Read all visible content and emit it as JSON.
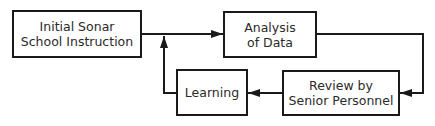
{
  "diagram": {
    "type": "flowchart",
    "colors": {
      "stroke": "#1a1a1a",
      "text": "#2a2a2a",
      "background": "#ffffff"
    },
    "nodes": [
      {
        "id": "initial",
        "lines": [
          "Initial Sonar",
          "School Instruction"
        ]
      },
      {
        "id": "analysis",
        "lines": [
          "Analysis",
          "of Data"
        ]
      },
      {
        "id": "review",
        "lines": [
          "Review by",
          "Senior Personnel"
        ]
      },
      {
        "id": "learning",
        "lines": [
          "Learning"
        ]
      }
    ],
    "edges": [
      {
        "from": "initial",
        "to": "analysis"
      },
      {
        "from": "analysis",
        "to": "review"
      },
      {
        "from": "review",
        "to": "learning"
      },
      {
        "from": "learning",
        "to": "initial-analysis-link"
      }
    ]
  }
}
